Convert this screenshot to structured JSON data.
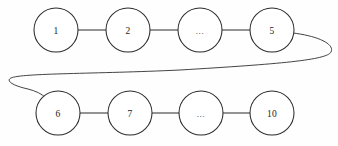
{
  "diagram": {
    "type": "node-link-chain",
    "background_color": "#fefefe",
    "stroke_color": "#2b2b2b",
    "node_fill_color": "#ffffff",
    "label_color": "#1a1a1a",
    "node_radius": 22,
    "rows": [
      {
        "row_name": "top-row",
        "center_y": 30,
        "nodes": [
          {
            "id": "node-1",
            "label": "1",
            "cx": 56,
            "cy": 30,
            "is_ellipsis": false
          },
          {
            "id": "node-2",
            "label": "2",
            "cx": 128,
            "cy": 30,
            "is_ellipsis": false
          },
          {
            "id": "node-ellipsis-top",
            "label": "...",
            "cx": 200,
            "cy": 30,
            "is_ellipsis": true
          },
          {
            "id": "node-5",
            "label": "5",
            "cx": 272,
            "cy": 30,
            "is_ellipsis": false
          }
        ]
      },
      {
        "row_name": "bottom-row",
        "center_y": 113,
        "nodes": [
          {
            "id": "node-6",
            "label": "6",
            "cx": 58,
            "cy": 113,
            "is_ellipsis": false
          },
          {
            "id": "node-7",
            "label": "7",
            "cx": 130,
            "cy": 113,
            "is_ellipsis": false
          },
          {
            "id": "node-ellipsis-bottom",
            "label": "...",
            "cx": 201,
            "cy": 113,
            "is_ellipsis": true
          },
          {
            "id": "node-10",
            "label": "10",
            "cx": 272,
            "cy": 113,
            "is_ellipsis": false
          }
        ]
      }
    ],
    "edges": [
      {
        "id": "edge-1-2",
        "from": "node-1",
        "to": "node-2",
        "kind": "straight",
        "x1": 78,
        "y1": 30,
        "x2": 106,
        "y2": 30
      },
      {
        "id": "edge-2-dots",
        "from": "node-2",
        "to": "node-ellipsis-top",
        "kind": "straight",
        "x1": 150,
        "y1": 30,
        "x2": 178,
        "y2": 30
      },
      {
        "id": "edge-dots-5",
        "from": "node-ellipsis-top",
        "to": "node-5",
        "kind": "straight",
        "x1": 222,
        "y1": 30,
        "x2": 250,
        "y2": 30
      },
      {
        "id": "edge-5-6-wrap",
        "from": "node-5",
        "to": "node-6",
        "kind": "wrap-curve",
        "path": "M 293 33 C 318 36, 335 44, 331 52 C 327 60, 280 64, 180 70 C 95 74, 22 73, 11 78 C 5 81, 14 86, 28 89 C 36 91, 42 94, 46 98"
      },
      {
        "id": "edge-6-7",
        "from": "node-6",
        "to": "node-7",
        "kind": "straight",
        "x1": 80,
        "y1": 113,
        "x2": 108,
        "y2": 113
      },
      {
        "id": "edge-7-dots",
        "from": "node-7",
        "to": "node-ellipsis-bottom",
        "kind": "straight",
        "x1": 152,
        "y1": 113,
        "x2": 179,
        "y2": 113
      },
      {
        "id": "edge-dots-10",
        "from": "node-ellipsis-bottom",
        "to": "node-10",
        "kind": "straight",
        "x1": 223,
        "y1": 113,
        "x2": 250,
        "y2": 113
      }
    ]
  }
}
